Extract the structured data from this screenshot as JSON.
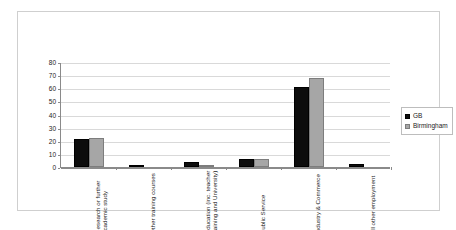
{
  "chart_data": {
    "type": "bar",
    "title": "",
    "subtitle": "",
    "xlabel": "",
    "ylabel": "",
    "ylim": [
      0,
      80
    ],
    "yticks": [
      0,
      10,
      20,
      30,
      40,
      50,
      60,
      70,
      80
    ],
    "grid": true,
    "legend_position": "right",
    "categories": [
      "Research or further academic study",
      "Other training courses",
      "Education (inc. teacher training and University)",
      "Public Service",
      "Industry & Commerce",
      "All other employment"
    ],
    "series": [
      {
        "name": "GB",
        "color": "#0d0d0d",
        "values": [
          21.5,
          1,
          4,
          6,
          61,
          2
        ]
      },
      {
        "name": "Birmingham",
        "color": "#a6a6a6",
        "values": [
          22,
          0,
          1,
          5.8,
          68,
          0.3
        ]
      }
    ]
  },
  "legend": {
    "items": [
      {
        "label": "GB",
        "swatch": "black-square-swatch"
      },
      {
        "label": "Birmingham",
        "swatch": "gray-square-swatch"
      }
    ]
  }
}
